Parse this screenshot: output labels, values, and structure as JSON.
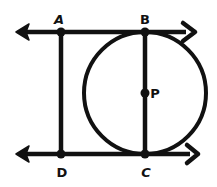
{
  "figure": {
    "width": 217,
    "height": 187,
    "stroke_color": "#111111",
    "background": "#ffffff",
    "stroke_width": 4.5
  },
  "lines": [
    {
      "name": "top-line",
      "x1": 17,
      "y1": 32,
      "x2": 194,
      "y2": 32,
      "arrows": [
        "left",
        "right"
      ]
    },
    {
      "name": "bottom-line",
      "x1": 17,
      "y1": 154,
      "x2": 198,
      "y2": 154,
      "arrows": [
        "left",
        "right"
      ]
    }
  ],
  "segments": [
    {
      "name": "segment-AD",
      "from": "A",
      "to": "D"
    },
    {
      "name": "segment-BC",
      "from": "B",
      "to": "C"
    }
  ],
  "circle": {
    "center": "P",
    "cx": 145,
    "cy": 93,
    "r": 61
  },
  "points": {
    "A": {
      "label": "A",
      "x": 61,
      "y": 32,
      "lx": 59,
      "ly": 24
    },
    "B": {
      "label": "B",
      "x": 145,
      "y": 32,
      "lx": 145,
      "ly": 24
    },
    "P": {
      "label": "P",
      "x": 145,
      "y": 93,
      "lx": 155,
      "ly": 98
    },
    "D": {
      "label": "D",
      "x": 61,
      "y": 154,
      "lx": 62,
      "ly": 177
    },
    "C": {
      "label": "C",
      "x": 145,
      "y": 154,
      "lx": 146,
      "ly": 177
    }
  }
}
